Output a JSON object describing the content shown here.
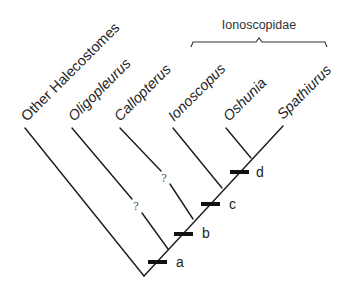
{
  "diagram": {
    "type": "cladogram",
    "taxa": [
      {
        "id": "other",
        "label": "Other Halecostomes",
        "tip": [
          25,
          128
        ],
        "text": [
          27,
          124
        ],
        "uncertain": false
      },
      {
        "id": "oligopleurus",
        "label": "Oligopleurus",
        "tip": [
          72,
          128
        ],
        "text": [
          75,
          124
        ],
        "uncertain": true
      },
      {
        "id": "callopterus",
        "label": "Callopterus",
        "tip": [
          120,
          128
        ],
        "text": [
          122,
          124
        ],
        "uncertain": true
      },
      {
        "id": "ionoscopus",
        "label": "Ionoscopus",
        "tip": [
          173,
          128
        ],
        "text": [
          175,
          124
        ],
        "uncertain": false
      },
      {
        "id": "oshunia",
        "label": "Oshunia",
        "tip": [
          226,
          128
        ],
        "text": [
          229,
          124
        ],
        "uncertain": false
      },
      {
        "id": "spathiurus",
        "label": "Spathiurus",
        "tip": [
          283,
          126
        ],
        "text": [
          283,
          124
        ],
        "uncertain": false
      }
    ],
    "nodes": [
      {
        "id": "a",
        "label": "a",
        "bar": [
          158,
          262
        ]
      },
      {
        "id": "b",
        "label": "b",
        "bar": [
          183,
          233
        ]
      },
      {
        "id": "c",
        "label": "c",
        "bar": [
          210,
          204
        ]
      },
      {
        "id": "d",
        "label": "d",
        "bar": [
          238,
          172
        ]
      }
    ],
    "uncertainty_mark": "?",
    "group": {
      "label": "Ionoscopidae",
      "brace_from_x": 191,
      "brace_to_x": 327,
      "brace_y": 42
    }
  }
}
